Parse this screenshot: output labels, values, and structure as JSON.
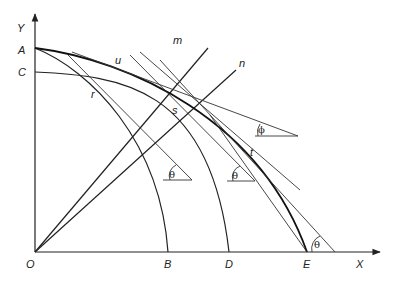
{
  "figure": {
    "type": "geometric construction diagram",
    "axes": {
      "x_label": "X",
      "y_label": "Y",
      "origin_label": "O"
    },
    "axis_points": {
      "y_axis": [
        "A",
        "C"
      ],
      "x_axis": [
        "B",
        "D",
        "E"
      ]
    },
    "point_labels": {
      "A": "A",
      "C": "C",
      "O": "O",
      "B": "B",
      "D": "D",
      "E": "E",
      "X": "X",
      "Y": "Y"
    },
    "ray_labels": {
      "m": "m",
      "n": "n"
    },
    "curve_labels": {
      "u": "u",
      "r": "r",
      "s": "s",
      "t": "t"
    },
    "angle_labels": {
      "theta_1": "θ",
      "theta_2": "θ",
      "theta_3": "θ",
      "phi": "ϕ"
    },
    "colors": {
      "line": "#222222",
      "background": "#ffffff"
    }
  }
}
